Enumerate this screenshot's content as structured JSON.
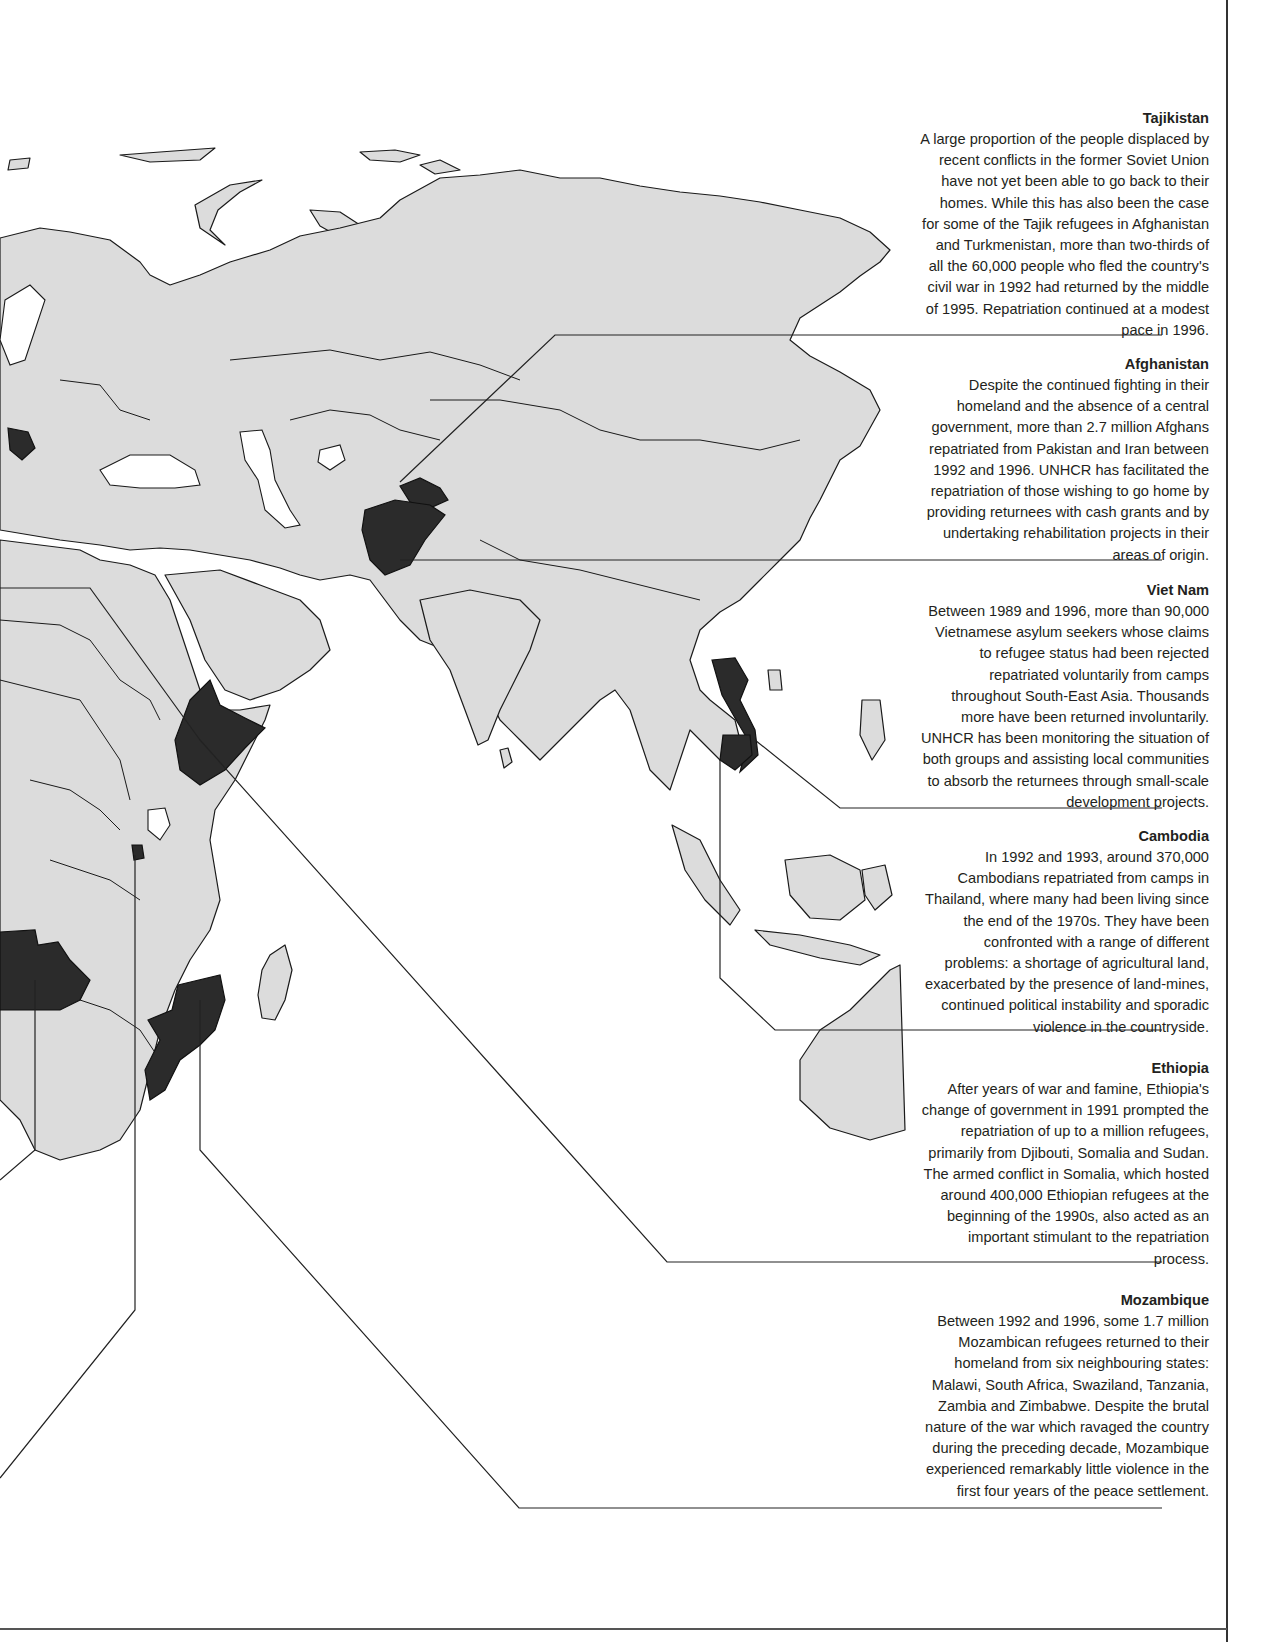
{
  "map": {
    "title": "Repatriation operations in Eastern Hemisphere",
    "highlight_color": "#2b2b2b",
    "land_color": "#dcdcdc",
    "water_color": "#ffffff",
    "highlighted_countries": [
      "Tajikistan",
      "Afghanistan",
      "Viet Nam",
      "Cambodia",
      "Ethiopia",
      "Mozambique",
      "Angola",
      "Rwanda",
      "Bosnia and Herzegovina"
    ]
  },
  "callouts": [
    {
      "title": "Tajikistan",
      "text": "A large proportion of the people displaced by recent conflicts in the former Soviet Union have not yet been able to go back to their homes.  While this has also been the case for some of the Tajik refugees in Afghanistan and Turkmenistan, more than two-thirds of all the 60,000 people who fled the country's civil war in 1992 had returned by the middle of 1995.  Repatriation continued at a modest pace in 1996."
    },
    {
      "title": "Afghanistan",
      "text": "Despite the continued fighting in their homeland and the absence of a central government, more than 2.7 million Afghans repatriated from Pakistan and Iran between 1992 and 1996.  UNHCR has facilitated the repatriation of those wishing to go home by providing returnees with cash grants and by undertaking rehabilitation projects in their areas of origin."
    },
    {
      "title": "Viet Nam",
      "text": "Between 1989 and 1996, more than 90,000 Vietnamese asylum seekers whose claims to refugee status had been rejected repatriated voluntarily from camps throughout South-East Asia.  Thousands more have been returned involuntarily. UNHCR has been monitoring the situation of both groups and assisting local communities to absorb the returnees through small-scale development projects."
    },
    {
      "title": "Cambodia",
      "text": "In 1992 and 1993, around 370,000 Cambodians repatriated from camps in Thailand, where many had been living since the end of the 1970s.  They have been confronted with a range of different problems: a shortage of agricultural land, exacerbated by the presence of land-mines, continued political instability and sporadic violence in the countryside."
    },
    {
      "title": "Ethiopia",
      "text": "After years of war and famine, Ethiopia's change of government in 1991 prompted the repatriation of up to a million refugees, primarily from Djibouti, Somalia and Sudan.  The armed conflict in Somalia, which hosted around 400,000 Ethiopian refugees at the beginning of the 1990s, also acted as an important stimulant to the repatriation process."
    },
    {
      "title": "Mozambique",
      "text": "Between 1992 and 1996, some 1.7 million Mozambican refugees returned to their homeland from six neighbouring states: Malawi, South Africa, Swaziland, Tanzania, Zambia and Zimbabwe.  Despite the brutal nature of the war which ravaged the country during the preceding decade, Mozambique experienced remarkably little violence in the first four years of the peace settlement."
    }
  ]
}
